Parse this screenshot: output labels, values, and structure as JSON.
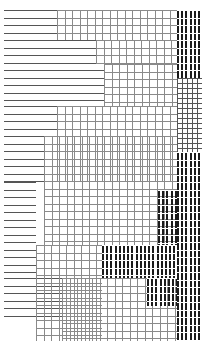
{
  "canvas": {
    "width": 204,
    "height": 356,
    "background": "#ffffff",
    "title": "Abstract Hatch Pattern"
  },
  "palette": {
    "stroke_light": "#8a8a8a",
    "stroke_mid": "#6e6e6e",
    "stroke_dark": "#1b1b1b",
    "background": "#ffffff"
  },
  "metrics": {
    "row_pitch": 7.5,
    "col_pitch": 7.5,
    "stroke_width": 1,
    "dense_bar_pitch": 4.2,
    "dense_bar_width": 2,
    "content_top": 10,
    "content_bottom": 341
  },
  "regions": [
    {
      "name": "top-left-horizontal-rules",
      "kind": "horizontal-rules",
      "tone": "mid",
      "x": 4,
      "y": 10,
      "width": 100,
      "height": 96,
      "row_pitch": 7.5,
      "stroke_width": 1
    },
    {
      "name": "upper-left-long-rules",
      "kind": "horizontal-rules",
      "tone": "mid",
      "x": 4,
      "y": 106,
      "width": 152,
      "height": 30,
      "row_pitch": 7.5,
      "stroke_width": 1
    },
    {
      "name": "mid-left-horizontal-rules",
      "kind": "horizontal-rules",
      "tone": "mid",
      "x": 4,
      "y": 136,
      "width": 40,
      "height": 46,
      "row_pitch": 7.5,
      "stroke_width": 1
    },
    {
      "name": "lower-left-horizontal-rules",
      "kind": "horizontal-rules",
      "tone": "mid",
      "x": 4,
      "y": 182,
      "width": 32,
      "height": 96,
      "row_pitch": 7.5,
      "stroke_width": 1
    },
    {
      "name": "bottom-left-horizontal-rules",
      "kind": "horizontal-rules",
      "tone": "mid",
      "x": 4,
      "y": 278,
      "width": 58,
      "height": 42,
      "row_pitch": 7.5,
      "stroke_width": 1
    },
    {
      "name": "top-center-grid",
      "kind": "grid",
      "tone": "light",
      "x": 57,
      "y": 10,
      "width": 120,
      "height": 30,
      "row_pitch": 7.5,
      "col_pitch": 7.5,
      "stroke_width": 1
    },
    {
      "name": "upper-center-grid",
      "kind": "grid",
      "tone": "light",
      "x": 96,
      "y": 40,
      "width": 81,
      "height": 24,
      "row_pitch": 7.5,
      "col_pitch": 7.5,
      "stroke_width": 1
    },
    {
      "name": "upper-right-grid",
      "kind": "grid",
      "tone": "light",
      "x": 104,
      "y": 64,
      "width": 73,
      "height": 42,
      "row_pitch": 7.5,
      "col_pitch": 7.5,
      "stroke_width": 1
    },
    {
      "name": "center-grid-large",
      "kind": "grid",
      "tone": "light",
      "x": 57,
      "y": 106,
      "width": 120,
      "height": 76,
      "row_pitch": 7.5,
      "col_pitch": 7.5,
      "stroke_width": 1
    },
    {
      "name": "center-left-grid",
      "kind": "grid",
      "tone": "light",
      "x": 44,
      "y": 136,
      "width": 133,
      "height": 109,
      "row_pitch": 7.5,
      "col_pitch": 7.5,
      "stroke_width": 1
    },
    {
      "name": "lower-center-grid",
      "kind": "grid",
      "tone": "light",
      "x": 36,
      "y": 245,
      "width": 66,
      "height": 96,
      "row_pitch": 7.5,
      "col_pitch": 7.5,
      "stroke_width": 1
    },
    {
      "name": "bottom-grid",
      "kind": "grid",
      "tone": "light",
      "x": 62,
      "y": 278,
      "width": 115,
      "height": 63,
      "row_pitch": 7.5,
      "col_pitch": 7.5,
      "stroke_width": 1
    },
    {
      "name": "right-dense-bars-upper",
      "kind": "dense-vertical-bars",
      "tone": "dark",
      "x": 177,
      "y": 10,
      "width": 25,
      "height": 68,
      "bar_pitch": 4.2,
      "bar_width": 2
    },
    {
      "name": "right-grid-inset",
      "kind": "grid",
      "tone": "mid",
      "x": 177,
      "y": 78,
      "width": 25,
      "height": 74,
      "row_pitch": 5,
      "col_pitch": 5,
      "stroke_width": 1
    },
    {
      "name": "right-dense-bars-lower",
      "kind": "dense-vertical-bars",
      "tone": "dark",
      "x": 177,
      "y": 152,
      "width": 25,
      "height": 189,
      "bar_pitch": 4.2,
      "bar_width": 2
    },
    {
      "name": "mid-right-dense-bars",
      "kind": "dense-vertical-bars",
      "tone": "dark",
      "x": 158,
      "y": 190,
      "width": 19,
      "height": 55,
      "bar_pitch": 4.2,
      "bar_width": 2
    },
    {
      "name": "lower-center-dense-bars",
      "kind": "dense-vertical-bars",
      "tone": "dark",
      "x": 102,
      "y": 245,
      "width": 75,
      "height": 33,
      "bar_pitch": 4.2,
      "bar_width": 2
    },
    {
      "name": "bottom-right-dense-bars",
      "kind": "dense-vertical-bars",
      "tone": "dark",
      "x": 147,
      "y": 278,
      "width": 30,
      "height": 28,
      "bar_pitch": 4.2,
      "bar_width": 2
    }
  ]
}
